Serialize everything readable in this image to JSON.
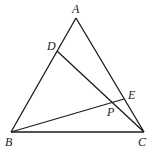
{
  "diagram": {
    "type": "geometry-triangle",
    "points": {
      "A": {
        "label": "A",
        "x": 76,
        "y": 18,
        "lx": 72,
        "ly": 3
      },
      "B": {
        "label": "B",
        "x": 11,
        "y": 132,
        "lx": 5,
        "ly": 136
      },
      "C": {
        "label": "C",
        "x": 144,
        "y": 132,
        "lx": 138,
        "ly": 136
      },
      "D": {
        "label": "D",
        "x": 57,
        "y": 51,
        "lx": 47,
        "ly": 40
      },
      "E": {
        "label": "E",
        "x": 124,
        "y": 99,
        "lx": 128,
        "ly": 89
      },
      "P": {
        "label": "P",
        "x": 114,
        "y": 102,
        "lx": 107,
        "ly": 106
      }
    },
    "segments": [
      [
        "A",
        "B"
      ],
      [
        "A",
        "C"
      ],
      [
        "B",
        "C"
      ],
      [
        "D",
        "C"
      ],
      [
        "B",
        "E"
      ]
    ],
    "stroke_color": "#1a1a1a"
  }
}
